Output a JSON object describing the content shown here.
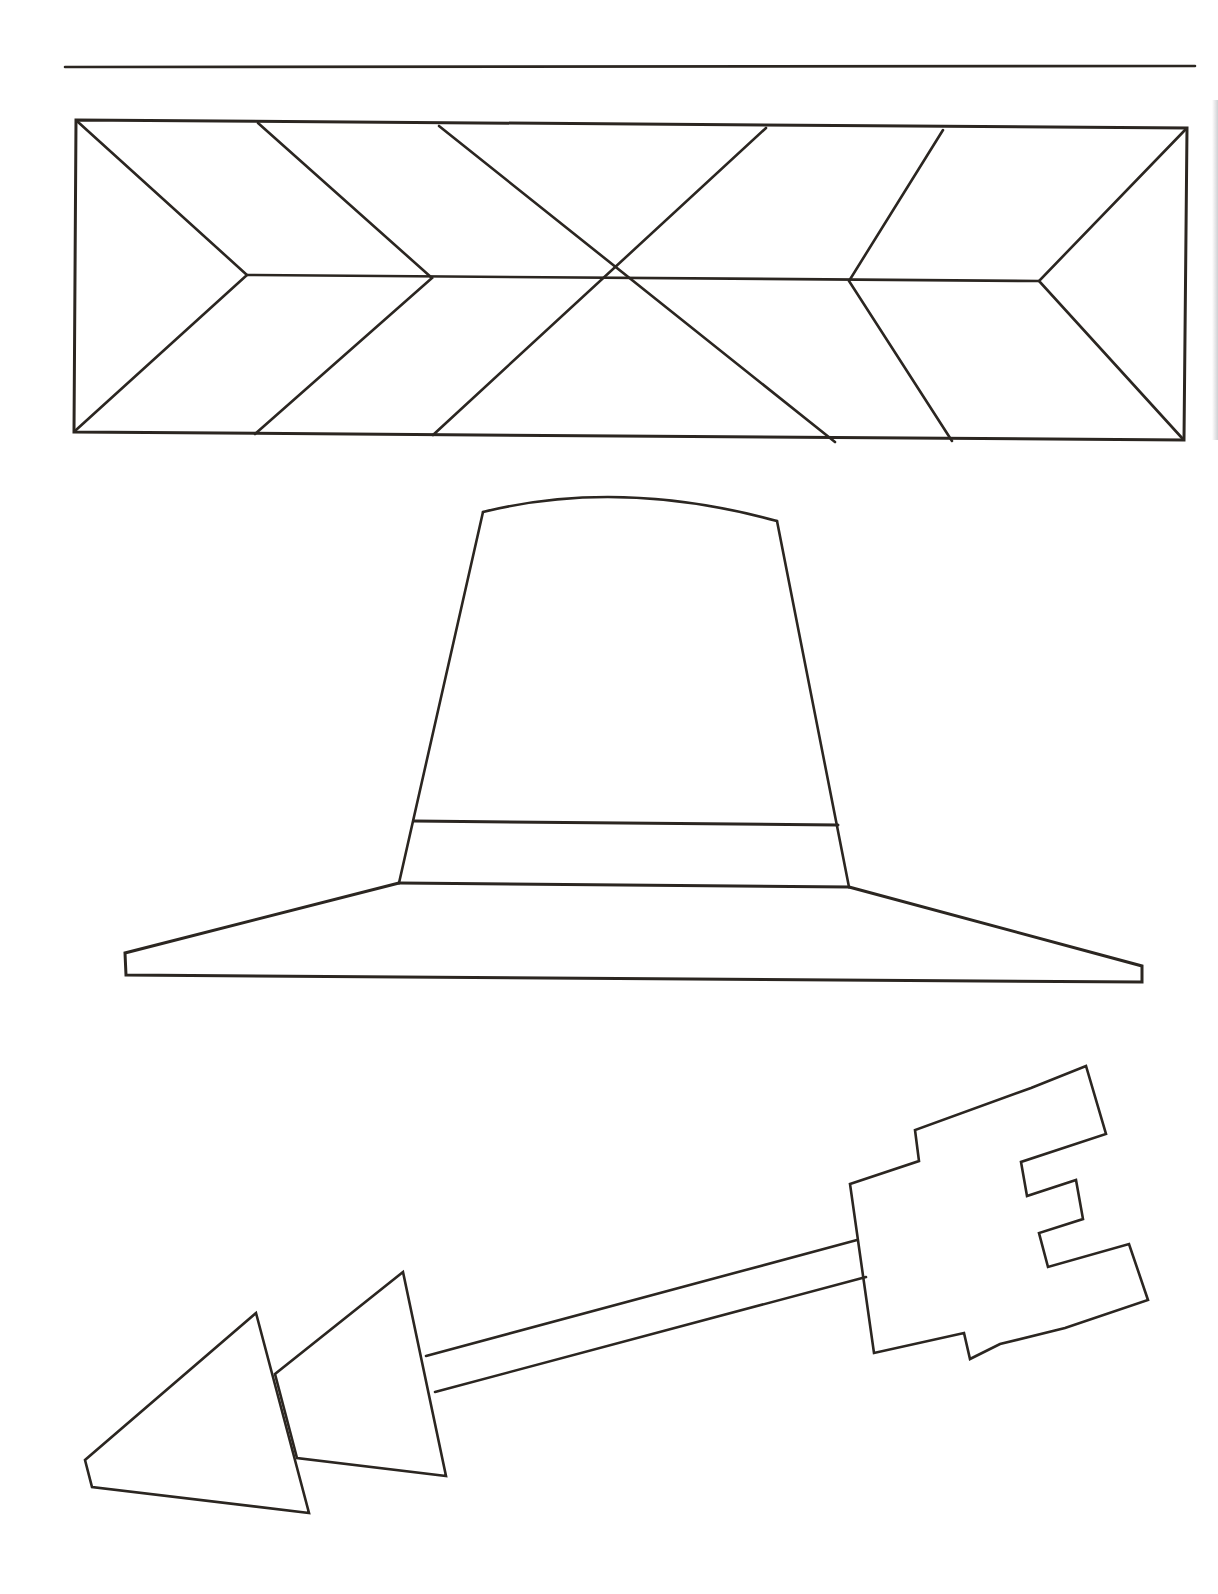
{
  "page": {
    "kind": "coloring-page",
    "background": "#ffffff",
    "ink_color": "#2b2621"
  },
  "figures": [
    {
      "id": "top-rule",
      "label": "horizontal rule"
    },
    {
      "id": "chevron-border",
      "label": "rectangular band with chevron / arrow-feather pattern"
    },
    {
      "id": "pilgrim-hat",
      "label": "pilgrim hat with band and wide brim"
    },
    {
      "id": "arrow",
      "label": "arrow with double triangular head and notched fletching"
    }
  ]
}
